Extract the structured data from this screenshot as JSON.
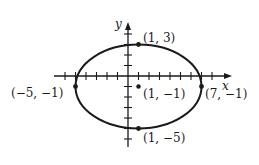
{
  "diagram": {
    "type": "ellipse-graph",
    "axes": {
      "x_label": "x",
      "y_label": "y"
    },
    "points": [
      {
        "label": "(1, 3)",
        "x": 1,
        "y": 3
      },
      {
        "label": "(−5, −1)",
        "x": -5,
        "y": -1
      },
      {
        "label": "(1, −1)",
        "x": 1,
        "y": -1
      },
      {
        "label": "(7, −1)",
        "x": 7,
        "y": -1
      },
      {
        "label": "(1, −5)",
        "x": 1,
        "y": -5
      }
    ],
    "center": {
      "x": 1,
      "y": -1
    },
    "semi_major": 6,
    "semi_minor": 4,
    "colors": {
      "curve": "#1a1a1a",
      "background": "#ffffff"
    }
  }
}
